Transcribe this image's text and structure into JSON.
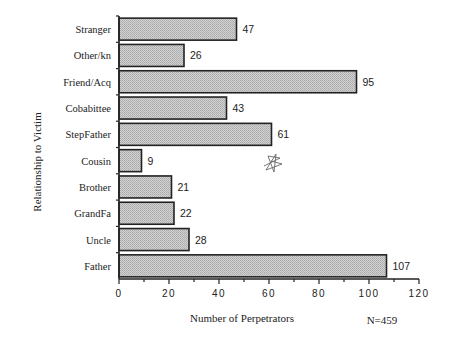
{
  "chart_data": {
    "type": "bar",
    "orientation": "horizontal",
    "title": "",
    "xlabel": "Number of Perpetrators",
    "ylabel": "Relationship to Victim",
    "annotation": "N=459",
    "categories": [
      "Stranger",
      "Other/kn",
      "Friend/Acq",
      "Cobabittee",
      "StepFather",
      "Cousin",
      "Brother",
      "GrandFa",
      "Uncle",
      "Father"
    ],
    "values": [
      47,
      26,
      95,
      43,
      61,
      9,
      21,
      22,
      28,
      107
    ],
    "xlim": [
      0,
      120
    ],
    "xticks": [
      0,
      20,
      40,
      60,
      80,
      100,
      120
    ],
    "xminor_step": 10,
    "grid": false,
    "legend": null,
    "bar_fill": "#c6c6c6",
    "bar_edge": "#222222"
  },
  "labels": {
    "ylabel": "Relationship to Victim",
    "xlabel": "Number of Perpetrators",
    "n_note": "N=459"
  }
}
